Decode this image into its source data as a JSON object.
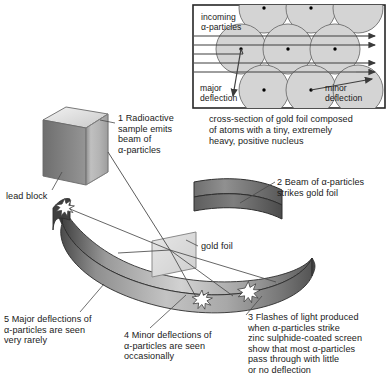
{
  "figure": {
    "width": 389,
    "height": 379,
    "background": "#ffffff"
  },
  "colors": {
    "ink": "#1a1a1a",
    "line": "#4a4a4a",
    "atom_fill": "#d4d4d4",
    "atom_stroke": "#6e6e6e",
    "nucleus": "#000000",
    "band_light": "#d9d9d9",
    "band_mid": "#9a9a9a",
    "band_dark": "#4f4f4f",
    "band_edge": "#2e2e2e",
    "foil_fill": "#dcdcdc",
    "foil_stroke": "#8a8a8a",
    "lead_top": "#e8e8e8",
    "lead_front": "#b4b4b4",
    "lead_side": "#8d8d8d",
    "star_fill": "#ffffff",
    "box_border": "#262626"
  },
  "inset": {
    "name": "cross-section-of-gold-foil-inset",
    "incoming_label": "incoming\nα-particles",
    "major_label": "major\ndeflection",
    "minor_label": "minor\ndeflection",
    "caption": "cross-section of gold foil composed\nof atoms with a tiny, extremely\nheavy, positive nucleus",
    "atom_count": 9,
    "incoming_ray_count": 5,
    "outgoing_arrow_count": 4
  },
  "main": {
    "lead_block_label": "lead block",
    "gold_foil_label": "gold foil",
    "steps": [
      {
        "number": "1",
        "text": "1 Radioactive\nsample emits\nbeam of\nα-particles"
      },
      {
        "number": "2",
        "text": "2 Beam of α-particles\nstrikes gold foil"
      },
      {
        "number": "3",
        "text": "3 Flashes of light produced\nwhen α-particles strike\nzinc sulphide-coated screen\nshow that most α-particles\npass through with little\nor no deflection"
      },
      {
        "number": "4",
        "text": "4 Minor deflections of\nα-particles are seen\noccasionally"
      },
      {
        "number": "5",
        "text": "5 Major deflections of\nα-particles are seen\nvery rarely"
      }
    ],
    "flash_count": 3,
    "screen_name": "zinc-sulphide-coated-screen"
  }
}
